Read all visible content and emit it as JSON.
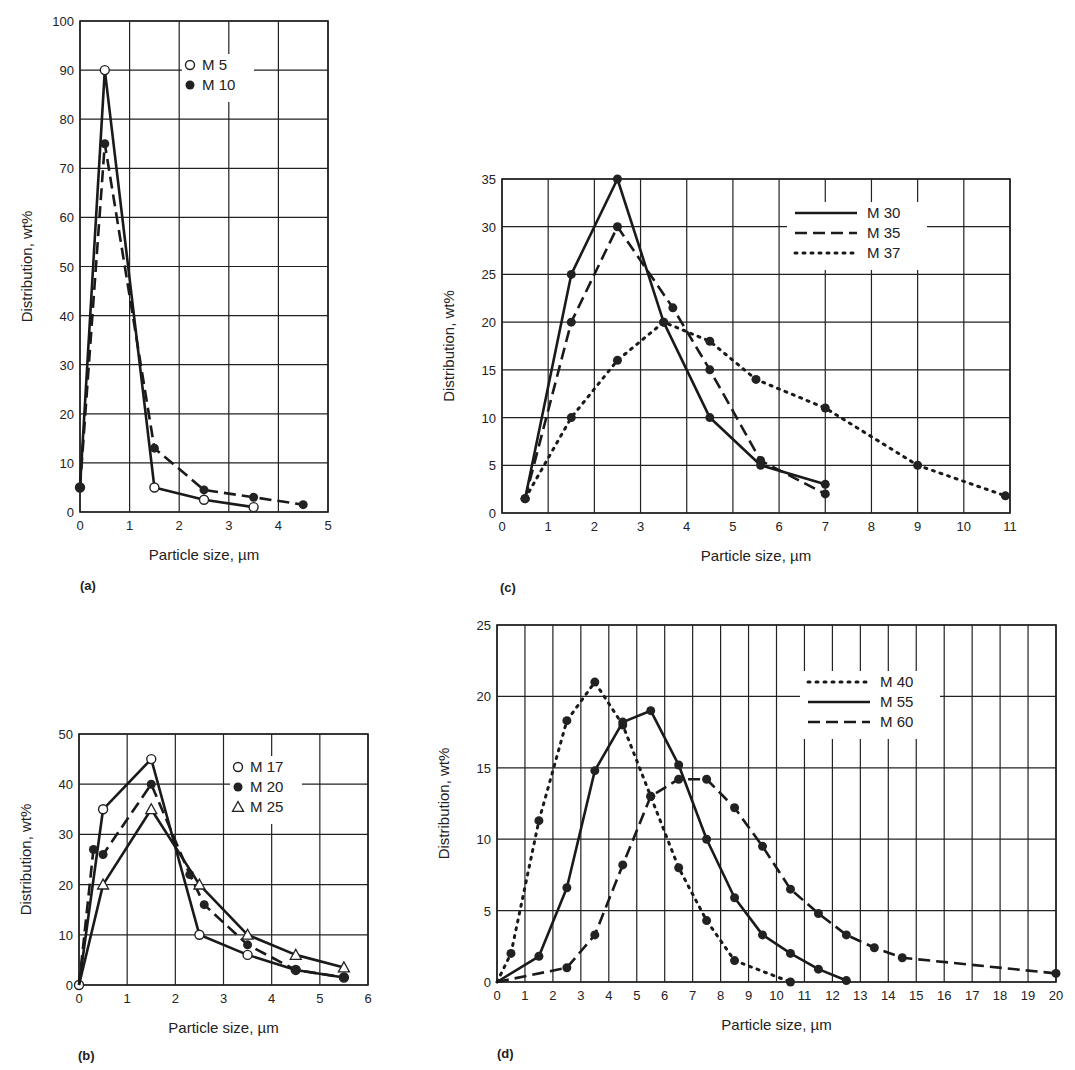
{
  "chart_data": [
    {
      "panel": "(a)",
      "type": "line",
      "title": "",
      "xlabel": "Particle size, µm",
      "ylabel": "Distribution, wt%",
      "xlim": [
        0,
        5
      ],
      "ylim": [
        0,
        100
      ],
      "xticks": [
        0,
        1,
        2,
        3,
        4,
        5
      ],
      "yticks": [
        0,
        10,
        20,
        30,
        40,
        50,
        60,
        70,
        80,
        90,
        100
      ],
      "grid": true,
      "legend_position": "upper center",
      "series": [
        {
          "name": "M 5",
          "style": "solid",
          "marker": "open-circle",
          "x": [
            0,
            0.5,
            1.5,
            2.5,
            3.5
          ],
          "y": [
            5,
            90,
            5,
            2.5,
            1
          ]
        },
        {
          "name": "M 10",
          "style": "dashed",
          "marker": "filled-circle",
          "x": [
            0,
            0.5,
            1.5,
            2.5,
            3.5,
            4.5
          ],
          "y": [
            5,
            75,
            13,
            4.5,
            3,
            1.5
          ]
        }
      ]
    },
    {
      "panel": "(b)",
      "type": "line",
      "title": "",
      "xlabel": "Particle size, µm",
      "ylabel": "Distribution, wt%",
      "xlim": [
        0,
        6
      ],
      "ylim": [
        0,
        50
      ],
      "xticks": [
        0,
        1,
        2,
        3,
        4,
        5,
        6
      ],
      "yticks": [
        0,
        10,
        20,
        30,
        40,
        50
      ],
      "grid": true,
      "legend_position": "upper right",
      "series": [
        {
          "name": "M 17",
          "style": "solid",
          "marker": "open-circle",
          "x": [
            0,
            0.5,
            1.5,
            2.5,
            3.5,
            4.5,
            5.5
          ],
          "y": [
            0,
            35,
            45,
            10,
            6,
            3,
            1.5
          ]
        },
        {
          "name": "M 20",
          "style": "dashed",
          "marker": "filled-circle",
          "x": [
            0,
            0.3,
            0.5,
            1.5,
            2.3,
            2.6,
            3.5,
            4.5,
            5.5
          ],
          "y": [
            0,
            27,
            26,
            40,
            22,
            16,
            8,
            3,
            1.5
          ]
        },
        {
          "name": "M 25",
          "style": "solid",
          "marker": "open-triangle",
          "x": [
            0,
            0.5,
            1.5,
            2.5,
            3.5,
            4.5,
            5.5
          ],
          "y": [
            0,
            20,
            35,
            20,
            10,
            6,
            3.5
          ]
        }
      ]
    },
    {
      "panel": "(c)",
      "type": "line",
      "title": "",
      "xlabel": "Particle size, µm",
      "ylabel": "Distribution, wt%",
      "xlim": [
        0,
        11
      ],
      "ylim": [
        0,
        35
      ],
      "xticks": [
        0,
        1,
        2,
        3,
        4,
        5,
        6,
        7,
        8,
        9,
        10,
        11
      ],
      "yticks": [
        0,
        5,
        10,
        15,
        20,
        25,
        30,
        35
      ],
      "grid": true,
      "legend_position": "upper right",
      "series": [
        {
          "name": "M 30",
          "style": "solid",
          "marker": "filled-circle",
          "x": [
            0.5,
            1.5,
            2.5,
            3.5,
            4.5,
            5.6,
            7
          ],
          "y": [
            1.5,
            25,
            35,
            20,
            10,
            5,
            3
          ]
        },
        {
          "name": "M 35",
          "style": "dashed",
          "marker": "filled-circle",
          "x": [
            0.5,
            1.5,
            2.5,
            3.7,
            4.5,
            5.6,
            7
          ],
          "y": [
            1.5,
            20,
            30,
            21.5,
            15,
            5.5,
            2
          ]
        },
        {
          "name": "M 37",
          "style": "dotted",
          "marker": "filled-circle",
          "x": [
            0.5,
            1.5,
            2.5,
            3.5,
            4.5,
            5.5,
            7,
            9,
            10.9
          ],
          "y": [
            1.5,
            10,
            16,
            20,
            18,
            14,
            11,
            5,
            1.8
          ]
        }
      ]
    },
    {
      "panel": "(d)",
      "type": "line",
      "title": "",
      "xlabel": "Particle size, µm",
      "ylabel": "Distribution, wt%",
      "xlim": [
        0,
        20
      ],
      "ylim": [
        0,
        25
      ],
      "xticks": [
        0,
        1,
        2,
        3,
        4,
        5,
        6,
        7,
        8,
        9,
        10,
        11,
        12,
        13,
        14,
        15,
        16,
        17,
        18,
        19,
        20
      ],
      "yticks": [
        0,
        5,
        10,
        15,
        20,
        25
      ],
      "grid": true,
      "legend_position": "upper center",
      "series": [
        {
          "name": "M 40",
          "style": "dotted",
          "marker": "filled-circle",
          "x": [
            0,
            0.5,
            1.5,
            2.5,
            3.5,
            4.5,
            5.5,
            6.5,
            7.5,
            8.5,
            10.5
          ],
          "y": [
            0,
            2,
            11.3,
            18.3,
            21,
            18,
            13,
            8,
            4.3,
            1.5,
            0
          ]
        },
        {
          "name": "M 55",
          "style": "solid",
          "marker": "filled-circle",
          "x": [
            0,
            1.5,
            2.5,
            3.5,
            4.5,
            5.5,
            6.5,
            7.5,
            8.5,
            9.5,
            10.5,
            11.5,
            12.5
          ],
          "y": [
            0,
            1.8,
            6.6,
            14.8,
            18.2,
            19,
            15.2,
            10,
            5.9,
            3.3,
            2,
            0.9,
            0.1
          ]
        },
        {
          "name": "M 60",
          "style": "dashed",
          "marker": "filled-circle",
          "x": [
            0,
            2.5,
            3.5,
            4.5,
            5.5,
            6.5,
            7.5,
            8.5,
            9.5,
            10.5,
            11.5,
            12.5,
            13.5,
            14.5,
            20
          ],
          "y": [
            0,
            1,
            3.3,
            8.2,
            13,
            14.2,
            14.2,
            12.2,
            9.5,
            6.5,
            4.8,
            3.3,
            2.4,
            1.7,
            0.6
          ]
        }
      ]
    }
  ],
  "layout": {
    "panels": {
      "(a)": {
        "left": 80,
        "top": 21,
        "right": 328,
        "bottom": 512,
        "legend": {
          "x": 190,
          "y": 70
        },
        "label_pos": [
          80,
          590
        ]
      },
      "(b)": {
        "left": 79,
        "top": 734,
        "right": 368,
        "bottom": 985,
        "legend": {
          "x": 238,
          "y": 772
        },
        "label_pos": [
          78,
          1060
        ]
      },
      "(c)": {
        "left": 502,
        "top": 179,
        "right": 1010,
        "bottom": 513,
        "legend": {
          "x": 795,
          "y": 218
        },
        "label_pos": [
          500,
          592
        ]
      },
      "(d)": {
        "left": 497,
        "top": 625,
        "right": 1056,
        "bottom": 982,
        "legend": {
          "x": 808,
          "y": 687
        },
        "label_pos": [
          497,
          1058
        ]
      }
    }
  }
}
